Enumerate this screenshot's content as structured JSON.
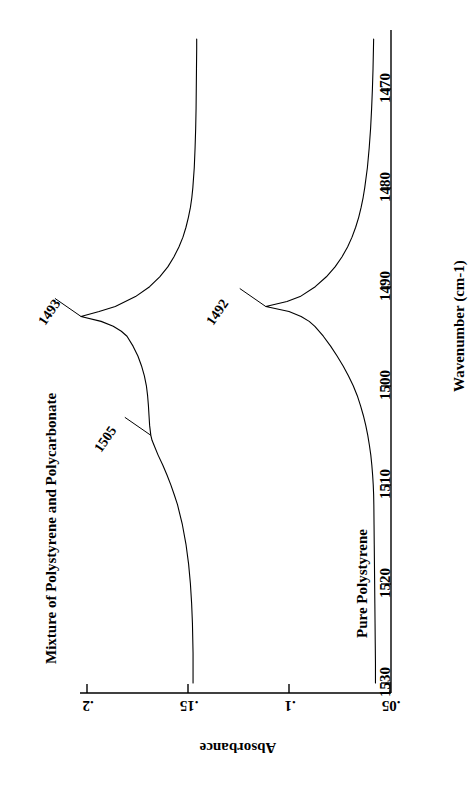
{
  "chart_data": {
    "type": "line",
    "title": "",
    "orientation": "rotated-90",
    "xlabel": "Wavenumber (cm-1)",
    "ylabel": "Absorbance",
    "xlim": [
      1530,
      1465
    ],
    "ylim": [
      0.21,
      0.048
    ],
    "xticks": [
      1530,
      1520,
      1510,
      1500,
      1490,
      1480,
      1470
    ],
    "xtick_labels": [
      "1530",
      "1520",
      "1510",
      "1500",
      "1490",
      "1480",
      "1470"
    ],
    "yticks": [
      0.2,
      0.15,
      0.1,
      0.05
    ],
    "ytick_labels": [
      ".2",
      ".15",
      ".1",
      ".05"
    ],
    "grid": false,
    "legend": "inline-captions",
    "series": [
      {
        "name": "Mixture of Polystyrene and Polycarbonate",
        "color": "#000000",
        "points": [
          [
            1530,
            0.1475
          ],
          [
            1527,
            0.1475
          ],
          [
            1524,
            0.1478
          ],
          [
            1522,
            0.1482
          ],
          [
            1520,
            0.1488
          ],
          [
            1518,
            0.1497
          ],
          [
            1516,
            0.151
          ],
          [
            1514,
            0.1528
          ],
          [
            1512,
            0.1552
          ],
          [
            1511,
            0.1568
          ],
          [
            1510,
            0.1585
          ],
          [
            1509,
            0.1604
          ],
          [
            1508,
            0.1625
          ],
          [
            1507,
            0.1648
          ],
          [
            1506,
            0.1668
          ],
          [
            1505.5,
            0.1678
          ],
          [
            1505,
            0.1684
          ],
          [
            1504,
            0.169
          ],
          [
            1503,
            0.1693
          ],
          [
            1502,
            0.1696
          ],
          [
            1501,
            0.17
          ],
          [
            1500,
            0.1706
          ],
          [
            1499,
            0.1716
          ],
          [
            1498,
            0.173
          ],
          [
            1497,
            0.1748
          ],
          [
            1496,
            0.1772
          ],
          [
            1495,
            0.1802
          ],
          [
            1494.5,
            0.183
          ],
          [
            1494,
            0.187
          ],
          [
            1493.5,
            0.193
          ],
          [
            1493,
            0.203
          ],
          [
            1492.5,
            0.194
          ],
          [
            1492,
            0.186
          ],
          [
            1491,
            0.176
          ],
          [
            1490,
            0.169
          ],
          [
            1489,
            0.164
          ],
          [
            1488,
            0.16
          ],
          [
            1487,
            0.157
          ],
          [
            1486,
            0.1545
          ],
          [
            1485,
            0.1525
          ],
          [
            1484,
            0.151
          ],
          [
            1483,
            0.1498
          ],
          [
            1482,
            0.1488
          ],
          [
            1481,
            0.1481
          ],
          [
            1480,
            0.1476
          ],
          [
            1478,
            0.1469
          ],
          [
            1476,
            0.1465
          ],
          [
            1474,
            0.1462
          ],
          [
            1472,
            0.146
          ],
          [
            1470,
            0.1459
          ],
          [
            1468,
            0.1458
          ],
          [
            1466,
            0.1457
          ],
          [
            1465,
            0.1457
          ]
        ],
        "annotations": [
          {
            "label": "1493",
            "x": 1493,
            "y": 0.203
          },
          {
            "label": "1505",
            "x": 1505,
            "y": 0.1684
          }
        ]
      },
      {
        "name": "Pure Polystyrene",
        "color": "#000000",
        "points": [
          [
            1530,
            0.0572
          ],
          [
            1528,
            0.0572
          ],
          [
            1526,
            0.0573
          ],
          [
            1524,
            0.0574
          ],
          [
            1522,
            0.0575
          ],
          [
            1520,
            0.0576
          ],
          [
            1518,
            0.0577
          ],
          [
            1516,
            0.0578
          ],
          [
            1514,
            0.0579
          ],
          [
            1512,
            0.058
          ],
          [
            1511,
            0.0581
          ],
          [
            1510,
            0.0583
          ],
          [
            1509,
            0.0586
          ],
          [
            1508,
            0.059
          ],
          [
            1507,
            0.0595
          ],
          [
            1506,
            0.0602
          ],
          [
            1505,
            0.061
          ],
          [
            1504,
            0.062
          ],
          [
            1503,
            0.0632
          ],
          [
            1502,
            0.0646
          ],
          [
            1501,
            0.0662
          ],
          [
            1500,
            0.0682
          ],
          [
            1499,
            0.0706
          ],
          [
            1498,
            0.0732
          ],
          [
            1497,
            0.0762
          ],
          [
            1496,
            0.0794
          ],
          [
            1495,
            0.083
          ],
          [
            1494,
            0.0872
          ],
          [
            1493.5,
            0.09
          ],
          [
            1493,
            0.094
          ],
          [
            1492.5,
            0.1
          ],
          [
            1492,
            0.1115
          ],
          [
            1491.5,
            0.101
          ],
          [
            1491,
            0.0945
          ],
          [
            1490,
            0.087
          ],
          [
            1489,
            0.0815
          ],
          [
            1488,
            0.0772
          ],
          [
            1487,
            0.0738
          ],
          [
            1486,
            0.071
          ],
          [
            1485,
            0.0688
          ],
          [
            1484,
            0.067
          ],
          [
            1483,
            0.0655
          ],
          [
            1482,
            0.0643
          ],
          [
            1481,
            0.0633
          ],
          [
            1480,
            0.0625
          ],
          [
            1478,
            0.0612
          ],
          [
            1476,
            0.0603
          ],
          [
            1474,
            0.0596
          ],
          [
            1472,
            0.0591
          ],
          [
            1470,
            0.0587
          ],
          [
            1468,
            0.0584
          ],
          [
            1466,
            0.0582
          ],
          [
            1465,
            0.0581
          ]
        ],
        "annotations": [
          {
            "label": "1492",
            "x": 1492,
            "y": 0.1115
          }
        ]
      }
    ]
  },
  "axes": {
    "x_title": "Wavenumber (cm-1)",
    "y_title": "Absorbance",
    "x_tick_0": "1530",
    "x_tick_1": "1520",
    "x_tick_2": "1510",
    "x_tick_3": "1500",
    "x_tick_4": "1490",
    "x_tick_5": "1480",
    "x_tick_6": "1470",
    "y_tick_0": ".2",
    "y_tick_1": ".15",
    "y_tick_2": ".1",
    "y_tick_3": ".05"
  },
  "captions": {
    "mixture": "Mixture of Polystyrene and Polycarbonate",
    "pure": "Pure Polystyrene"
  },
  "peaks": {
    "mixture_main": "1493",
    "mixture_shoulder": "1505",
    "pure_main": "1492"
  },
  "colors": {
    "line": "#000000",
    "axis": "#000000",
    "background": "#ffffff"
  }
}
